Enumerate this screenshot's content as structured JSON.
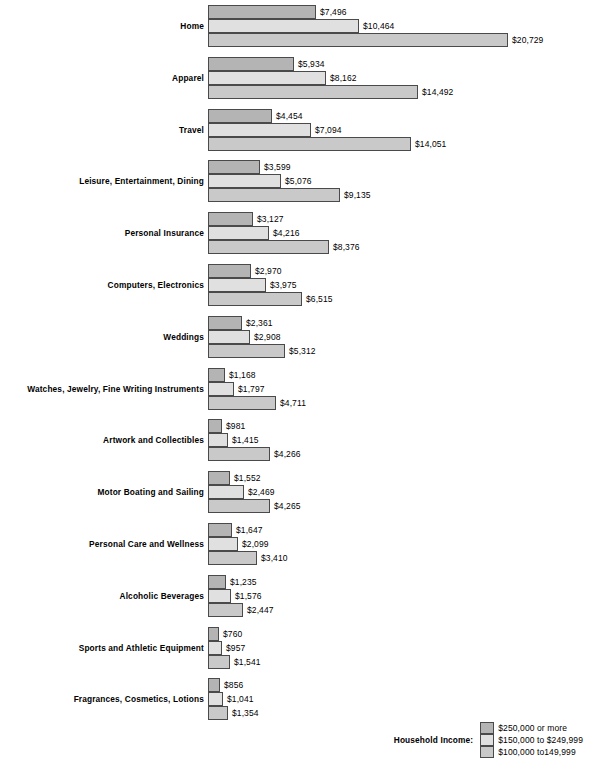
{
  "chart_data": {
    "type": "bar",
    "orientation": "horizontal",
    "title": "",
    "subtitle": "",
    "xlabel": "",
    "ylabel": "",
    "grid": false,
    "xlim": [
      0,
      20729
    ],
    "legend_position": "bottom-right",
    "legend_title": "Household Income:",
    "value_prefix": "$",
    "categories": [
      "Home",
      "Apparel",
      "Travel",
      "Leisure, Entertainment, Dining",
      "Personal Insurance",
      "Computers, Electronics",
      "Weddings",
      "Watches, Jewelry, Fine Writing Instruments",
      "Artwork and Collectibles",
      "Motor Boating and Sailing",
      "Personal Care and Wellness",
      "Alcoholic Beverages",
      "Sports and Athletic Equipment",
      "Fragrances, Cosmetics, Lotions"
    ],
    "series": [
      {
        "name": "$250,000 or more",
        "color": "#b4b4b4",
        "values": [
          7496,
          5934,
          4454,
          3599,
          3127,
          2970,
          2361,
          1168,
          981,
          1552,
          1647,
          1235,
          760,
          856
        ],
        "labels": [
          "$7,496",
          "$5,934",
          "$4,454",
          "$3,599",
          "$3,127",
          "$2,970",
          "$2,361",
          "$1,168",
          "$981",
          "$1,552",
          "$1,647",
          "$1,235",
          "$760",
          "$856"
        ]
      },
      {
        "name": "$150,000 to $249,999",
        "color": "#e0e0e0",
        "values": [
          10464,
          8162,
          7094,
          5076,
          4216,
          3975,
          2908,
          1797,
          1415,
          2469,
          2099,
          1576,
          957,
          1041
        ],
        "labels": [
          "$10,464",
          "$8,162",
          "$7,094",
          "$5,076",
          "$4,216",
          "$3,975",
          "$2,908",
          "$1,797",
          "$1,415",
          "$2,469",
          "$2,099",
          "$1,576",
          "$957",
          "$1,041"
        ]
      },
      {
        "name": "$100,000 to149,999",
        "color": "#c9c9c9",
        "values": [
          20729,
          14492,
          14051,
          9135,
          8376,
          6515,
          5312,
          4711,
          4266,
          4265,
          3410,
          2447,
          1541,
          1354
        ],
        "labels": [
          "$20,729",
          "$14,492",
          "$14,051",
          "$9,135",
          "$8,376",
          "$6,515",
          "$5,312",
          "$4,711",
          "$4,266",
          "$4,265",
          "$3,410",
          "$2,447",
          "$1,541",
          "$1,354"
        ]
      }
    ]
  },
  "legend": {
    "title": "Household Income:",
    "items": [
      {
        "label": "$250,000 or more",
        "swatch": "s0"
      },
      {
        "label": "$150,000 to $249,999",
        "swatch": "s1"
      },
      {
        "label": "$100,000 to149,999",
        "swatch": "s2"
      }
    ]
  },
  "layout": {
    "bar_origin_x": 208,
    "px_per_unit": 0.014473,
    "bar_height": 14,
    "group_top_start": 5,
    "group_pitch": 51.8,
    "label_gap": 4
  }
}
